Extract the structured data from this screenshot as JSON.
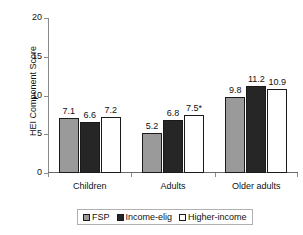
{
  "chart_data": {
    "type": "bar",
    "title": "",
    "xlabel": "",
    "ylabel": "HEI Component Score",
    "ylim": [
      0,
      20
    ],
    "yticks": [
      0,
      5,
      10,
      15,
      20
    ],
    "ytick_labels": [
      "0",
      "5",
      "10",
      "15",
      "20"
    ],
    "grid": false,
    "legend_position": "bottom",
    "categories": [
      "Children",
      "Adults",
      "Older adults"
    ],
    "series": [
      {
        "name": "FSP",
        "color": "#9a9a9a",
        "values": [
          7.1,
          5.2,
          9.8
        ],
        "labels": [
          "7.1",
          "5.2",
          "9.8"
        ]
      },
      {
        "name": "Income-elig",
        "color": "#262626",
        "values": [
          6.6,
          6.8,
          11.2
        ],
        "labels": [
          "6.6",
          "6.8",
          "11.2"
        ]
      },
      {
        "name": "Higher-income",
        "color": "#ffffff",
        "values": [
          7.2,
          7.5,
          10.9
        ],
        "labels": [
          "7.2",
          "7.5*",
          "10.9"
        ]
      }
    ],
    "annotations": [
      {
        "text": "*",
        "attached_to": "Higher-income / Adults",
        "meaning": "significance marker"
      }
    ]
  }
}
